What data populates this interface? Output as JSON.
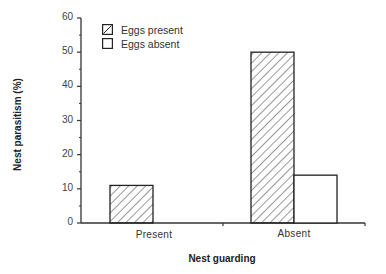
{
  "chart_data": {
    "type": "bar",
    "title": "",
    "xlabel": "Nest guarding",
    "ylabel": "Nest parasitism (%)",
    "categories": [
      "Present",
      "Absent"
    ],
    "series": [
      {
        "name": "Eggs present",
        "pattern": "hatched",
        "values": [
          11,
          50
        ]
      },
      {
        "name": "Eggs absent",
        "pattern": "open",
        "values": [
          0,
          14
        ]
      }
    ],
    "ylim": [
      0,
      60
    ],
    "yticks": [
      0,
      10,
      20,
      30,
      40,
      50,
      60
    ],
    "ytick_labels": [
      "0",
      "10",
      "20",
      "30",
      "40",
      "50",
      "60"
    ],
    "grid": false,
    "legend_position": "upper left"
  },
  "legend": {
    "items": [
      {
        "label": "Eggs present"
      },
      {
        "label": "Eggs absent"
      }
    ]
  },
  "axes": {
    "x_title": "Nest guarding",
    "y_title": "Nest parasitism (%)",
    "categories": [
      "Present",
      "Absent"
    ],
    "y_ticks": [
      "0",
      "10",
      "20",
      "30",
      "40",
      "50",
      "60"
    ]
  }
}
